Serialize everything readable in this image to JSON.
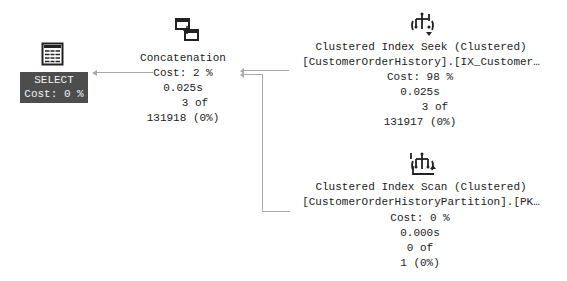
{
  "plan": {
    "select": {
      "icon": "result-table-icon",
      "label": "SELECT",
      "cost": "Cost: 0 %"
    },
    "concatenation": {
      "icon": "concatenation-icon",
      "label": "Concatenation",
      "cost": "Cost: 2 %",
      "time": "0.025s",
      "rows_of": "3 of",
      "estimate": "131918 (0%)"
    },
    "seek": {
      "icon": "clustered-index-seek-icon",
      "label": "Clustered Index Seek (Clustered)",
      "object": "[CustomerOrderHistory].[IX_Customer…",
      "cost": "Cost: 98 %",
      "time": "0.025s",
      "rows_of": "3 of",
      "estimate": "131917 (0%)"
    },
    "scan": {
      "icon": "clustered-index-scan-icon",
      "label": "Clustered Index Scan (Clustered)",
      "object": "[CustomerOrderHistoryPartition].[PK…",
      "cost": "Cost: 0 %",
      "time": "0.000s",
      "rows_of": "0 of",
      "estimate": "1 (0%)"
    }
  },
  "colors": {
    "select_bg": "#4d4d4d",
    "connector": "#a9a9a9",
    "text": "#222222"
  }
}
